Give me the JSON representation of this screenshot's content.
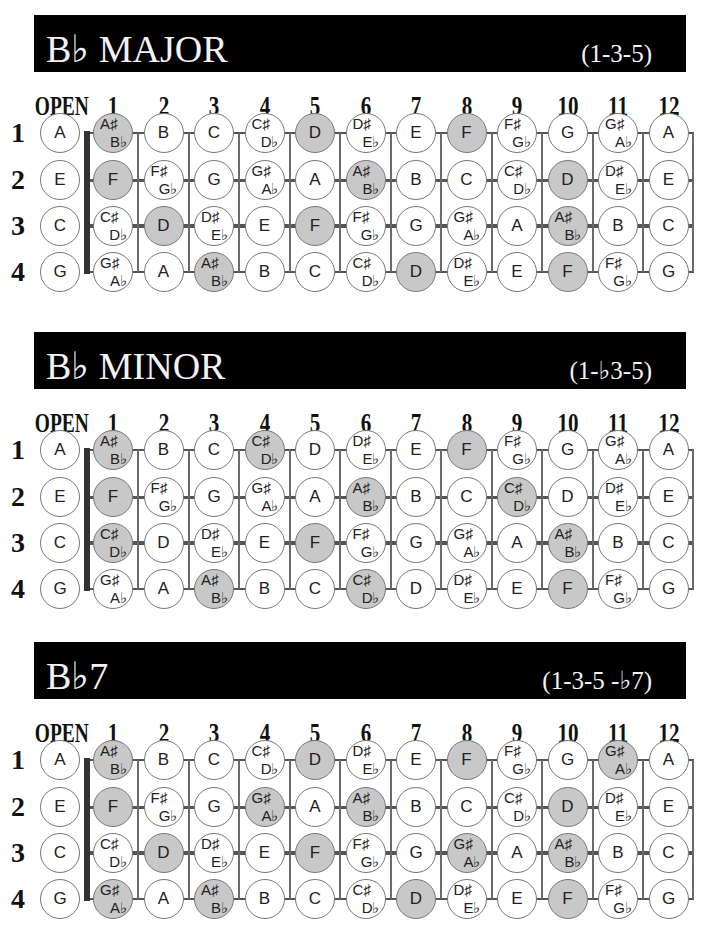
{
  "colors": {
    "title_bar_bg": "#000000",
    "title_text": "#f2f2f2",
    "highlight_fill": "#c8c8c8",
    "circle_stroke": "#777777",
    "nut": "#333333"
  },
  "fret_headers": [
    "OPEN",
    "1",
    "2",
    "3",
    "4",
    "5",
    "6",
    "7",
    "8",
    "9",
    "10",
    "11",
    "12"
  ],
  "string_labels": [
    "1",
    "2",
    "3",
    "4"
  ],
  "fretboard_notes": [
    [
      "A",
      "A♯/B♭",
      "B",
      "C",
      "C♯/D♭",
      "D",
      "D♯/E♭",
      "E",
      "F",
      "F♯/G♭",
      "G",
      "G♯/A♭",
      "A"
    ],
    [
      "E",
      "F",
      "F♯/G♭",
      "G",
      "G♯/A♭",
      "A",
      "A♯/B♭",
      "B",
      "C",
      "C♯/D♭",
      "D",
      "D♯/E♭",
      "E"
    ],
    [
      "C",
      "C♯/D♭",
      "D",
      "D♯/E♭",
      "E",
      "F",
      "F♯/G♭",
      "G",
      "G♯/A♭",
      "A",
      "A♯/B♭",
      "B",
      "C"
    ],
    [
      "G",
      "G♯/A♭",
      "A",
      "A♯/B♭",
      "B",
      "C",
      "C♯/D♭",
      "D",
      "D♯/E♭",
      "E",
      "F",
      "F♯/G♭",
      "G"
    ]
  ],
  "charts": [
    {
      "title": "B♭ MAJOR",
      "formula": "(1-3-5)",
      "chord_tones": [
        "B♭",
        "D",
        "F"
      ],
      "highlighted": [
        [
          1,
          5,
          8
        ],
        [
          1,
          6,
          10
        ],
        [
          2,
          5,
          10
        ],
        [
          3,
          7,
          10
        ]
      ]
    },
    {
      "title": "B♭ MINOR",
      "formula": "(1-♭3-5)",
      "chord_tones": [
        "B♭",
        "D♭",
        "F"
      ],
      "highlighted": [
        [
          1,
          4,
          8
        ],
        [
          1,
          6,
          9
        ],
        [
          1,
          5,
          10
        ],
        [
          3,
          6,
          10
        ]
      ]
    },
    {
      "title": "B♭7",
      "formula": "(1-3-5 -♭7)",
      "chord_tones": [
        "B♭",
        "D",
        "F",
        "A♭"
      ],
      "highlighted": [
        [
          1,
          5,
          8,
          11
        ],
        [
          1,
          4,
          6,
          10
        ],
        [
          2,
          5,
          8,
          10
        ],
        [
          1,
          3,
          7,
          10
        ]
      ]
    }
  ]
}
